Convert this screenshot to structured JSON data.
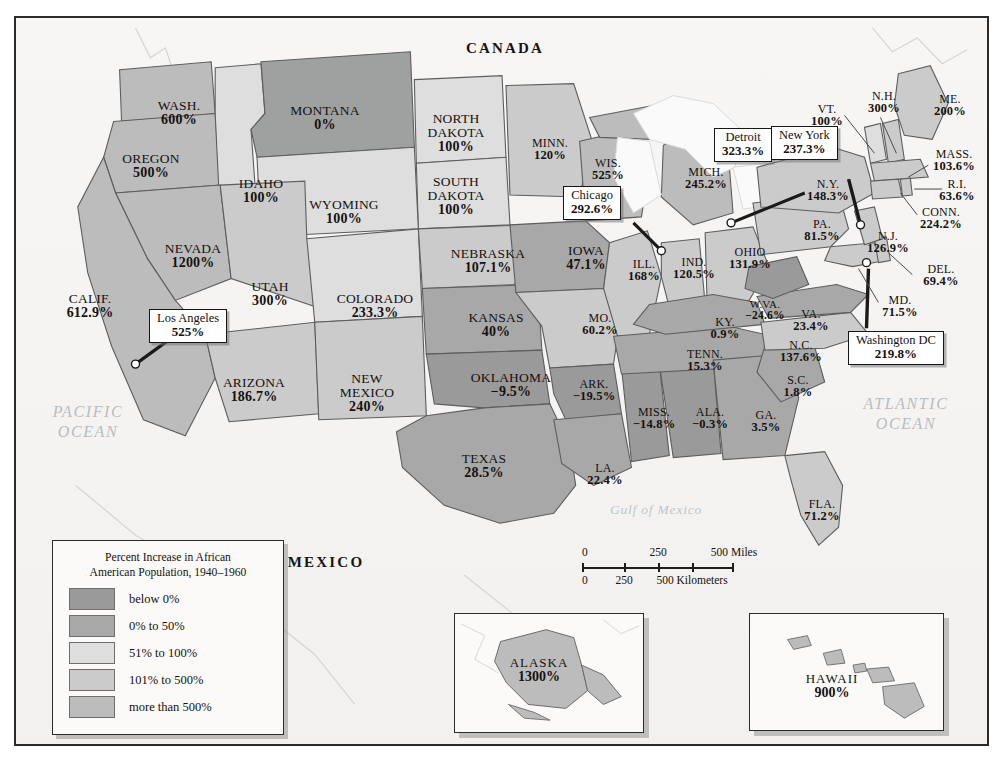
{
  "map": {
    "title_countries": {
      "canada": "CANADA",
      "mexico": "MEXICO"
    },
    "oceans": {
      "pacific_line1": "PACIFIC",
      "pacific_line2": "OCEAN",
      "atlantic_line1": "ATLANTIC",
      "atlantic_line2": "OCEAN",
      "gulf": "Gulf of Mexico"
    }
  },
  "legend": {
    "title_line1": "Percent Increase in African",
    "title_line2": "American Population, 1940–1960",
    "items": [
      {
        "label": "below 0%",
        "color": "#9a9a9a"
      },
      {
        "label": "0% to 50%",
        "color": "#a8a8a8"
      },
      {
        "label": "51% to 100%",
        "color": "#dedede"
      },
      {
        "label": "101% to 500%",
        "color": "#cbcbcb"
      },
      {
        "label": "more than 500%",
        "color": "#bcbcbc"
      }
    ]
  },
  "scale": {
    "miles_ticks": [
      "0",
      "250",
      "500 Miles"
    ],
    "km_ticks": [
      "0",
      "250",
      "500 Kilometers"
    ]
  },
  "callouts": [
    {
      "name": "Los Angeles",
      "value": "525%"
    },
    {
      "name": "Chicago",
      "value": "292.6%"
    },
    {
      "name": "Detroit",
      "value": "323.3%"
    },
    {
      "name": "New York",
      "value": "237.3%"
    },
    {
      "name": "Washington DC",
      "value": "219.8%"
    }
  ],
  "insets": [
    {
      "name": "ALASKA",
      "value": "1300%"
    },
    {
      "name": "HAWAII",
      "value": "900%"
    }
  ],
  "chart_data": {
    "type": "map",
    "unit": "percent",
    "categories": [
      "WASH.",
      "OREGON",
      "IDAHO",
      "MONTANA",
      "NORTH DAKOTA",
      "SOUTH DAKOTA",
      "WYOMING",
      "NEVADA",
      "UTAH",
      "COLORADO",
      "NEBRASKA",
      "KANSAS",
      "CALIF.",
      "ARIZONA",
      "NEW MEXICO",
      "OKLAHOMA",
      "TEXAS",
      "MINN.",
      "WIS.",
      "IOWA",
      "MO.",
      "ARK.",
      "LA.",
      "MISS.",
      "ALA.",
      "ILL.",
      "IND.",
      "MICH.",
      "OHIO",
      "KY.",
      "TENN.",
      "GA.",
      "FLA.",
      "S.C.",
      "N.C.",
      "VA.",
      "W.VA.",
      "MD.",
      "DEL.",
      "PA.",
      "N.J.",
      "N.Y.",
      "CONN.",
      "R.I.",
      "MASS.",
      "VT.",
      "N.H.",
      "ME.",
      "ALASKA",
      "HAWAII"
    ],
    "values": [
      600,
      500,
      100,
      0,
      100,
      100,
      100,
      1200,
      300,
      233.3,
      107.1,
      40,
      612.9,
      186.7,
      240,
      -9.5,
      28.5,
      120,
      525,
      47.1,
      60.2,
      -19.5,
      22.4,
      -14.8,
      -0.3,
      168,
      120.5,
      245.2,
      131.9,
      0.9,
      15.3,
      3.5,
      71.2,
      1.8,
      137.6,
      23.4,
      -24.6,
      71.5,
      69.4,
      81.5,
      126.9,
      148.3,
      224.2,
      63.6,
      103.6,
      100,
      300,
      200,
      1300,
      900
    ],
    "city_values": {
      "Los Angeles": 525,
      "Chicago": 292.6,
      "Detroit": 323.3,
      "New York": 237.3,
      "Washington DC": 219.8
    },
    "bins": [
      "below 0%",
      "0% to 50%",
      "51% to 100%",
      "101% to 500%",
      "more than 500%"
    ]
  },
  "states": [
    {
      "nm": "WASH.",
      "pct": "600%",
      "x": 163,
      "y": 95,
      "cls": ""
    },
    {
      "nm": "OREGON",
      "pct": "500%",
      "x": 135,
      "y": 148,
      "cls": ""
    },
    {
      "nm": "IDAHO",
      "pct": "100%",
      "x": 245,
      "y": 173,
      "cls": ""
    },
    {
      "nm": "MONTANA",
      "pct": "0%",
      "x": 309,
      "y": 100,
      "cls": ""
    },
    {
      "nm": "NORTH\nDAKOTA",
      "pct": "100%",
      "x": 440,
      "y": 115,
      "cls": ""
    },
    {
      "nm": "SOUTH\nDAKOTA",
      "pct": "100%",
      "x": 440,
      "y": 178,
      "cls": ""
    },
    {
      "nm": "WYOMING",
      "pct": "100%",
      "x": 328,
      "y": 194,
      "cls": ""
    },
    {
      "nm": "NEVADA",
      "pct": "1200%",
      "x": 177,
      "y": 238,
      "cls": ""
    },
    {
      "nm": "UTAH",
      "pct": "300%",
      "x": 254,
      "y": 276,
      "cls": ""
    },
    {
      "nm": "COLORADO",
      "pct": "233.3%",
      "x": 359,
      "y": 288,
      "cls": ""
    },
    {
      "nm": "NEBRASKA",
      "pct": "107.1%",
      "x": 472,
      "y": 243,
      "cls": ""
    },
    {
      "nm": "KANSAS",
      "pct": "40%",
      "x": 480,
      "y": 307,
      "cls": ""
    },
    {
      "nm": "CALIF.",
      "pct": "612.9%",
      "x": 74,
      "y": 288,
      "cls": ""
    },
    {
      "nm": "ARIZONA",
      "pct": "186.7%",
      "x": 238,
      "y": 372,
      "cls": ""
    },
    {
      "nm": "NEW\nMEXICO",
      "pct": "240%",
      "x": 351,
      "y": 375,
      "cls": ""
    },
    {
      "nm": "OKLAHOMA",
      "pct": "−9.5%",
      "x": 495,
      "y": 367,
      "cls": ""
    },
    {
      "nm": "TEXAS",
      "pct": "28.5%",
      "x": 468,
      "y": 448,
      "cls": ""
    },
    {
      "nm": "MINN.",
      "pct": "120%",
      "x": 534,
      "y": 131,
      "cls": "sm"
    },
    {
      "nm": "WIS.",
      "pct": "525%",
      "x": 592,
      "y": 151,
      "cls": "sm"
    },
    {
      "nm": "IOWA",
      "pct": "47.1%",
      "x": 570,
      "y": 240,
      "cls": ""
    },
    {
      "nm": "MO.",
      "pct": "60.2%",
      "x": 584,
      "y": 306,
      "cls": "sm"
    },
    {
      "nm": "ARK.",
      "pct": "−19.5%",
      "x": 578,
      "y": 372,
      "cls": "sm"
    },
    {
      "nm": "LA.",
      "pct": "22.4%",
      "x": 589,
      "y": 456,
      "cls": "sm"
    },
    {
      "nm": "MISS.",
      "pct": "−14.8%",
      "x": 638,
      "y": 400,
      "cls": "sm"
    },
    {
      "nm": "ALA.",
      "pct": "−0.3%",
      "x": 694,
      "y": 400,
      "cls": "sm"
    },
    {
      "nm": "ILL.",
      "pct": "168%",
      "x": 628,
      "y": 252,
      "cls": "sm"
    },
    {
      "nm": "IND.",
      "pct": "120.5%",
      "x": 678,
      "y": 250,
      "cls": "sm"
    },
    {
      "nm": "MICH.",
      "pct": "245.2%",
      "x": 690,
      "y": 160,
      "cls": "sm"
    },
    {
      "nm": "OHIO",
      "pct": "131.9%",
      "x": 734,
      "y": 240,
      "cls": "sm"
    },
    {
      "nm": "KY.",
      "pct": "0.9%",
      "x": 709,
      "y": 310,
      "cls": "sm"
    },
    {
      "nm": "TENN.",
      "pct": "15.3%",
      "x": 689,
      "y": 342,
      "cls": "sm"
    },
    {
      "nm": "GA.",
      "pct": "3.5%",
      "x": 750,
      "y": 403,
      "cls": "sm"
    },
    {
      "nm": "FLA.",
      "pct": "71.2%",
      "x": 806,
      "y": 492,
      "cls": "sm"
    },
    {
      "nm": "S.C.",
      "pct": "1.8%",
      "x": 782,
      "y": 368,
      "cls": "sm"
    },
    {
      "nm": "N.C.",
      "pct": "137.6%",
      "x": 785,
      "y": 333,
      "cls": "sm"
    },
    {
      "nm": "VA.",
      "pct": "23.4%",
      "x": 795,
      "y": 302,
      "cls": "sm"
    },
    {
      "nm": "W.VA.",
      "pct": "−24.6%",
      "x": 749,
      "y": 292,
      "cls": "xs"
    },
    {
      "nm": "MD.",
      "pct": "71.5%",
      "x": 884,
      "y": 288,
      "cls": "sm"
    },
    {
      "nm": "DEL.",
      "pct": "69.4%",
      "x": 925,
      "y": 257,
      "cls": "sm"
    },
    {
      "nm": "PA.",
      "pct": "81.5%",
      "x": 806,
      "y": 212,
      "cls": "sm"
    },
    {
      "nm": "N.J.",
      "pct": "126.9%",
      "x": 872,
      "y": 224,
      "cls": "sm"
    },
    {
      "nm": "N.Y.",
      "pct": "148.3%",
      "x": 812,
      "y": 172,
      "cls": "sm"
    },
    {
      "nm": "CONN.",
      "pct": "224.2%",
      "x": 925,
      "y": 200,
      "cls": "sm"
    },
    {
      "nm": "R.I.",
      "pct": "63.6%",
      "x": 941,
      "y": 172,
      "cls": "sm"
    },
    {
      "nm": "MASS.",
      "pct": "103.6%",
      "x": 938,
      "y": 142,
      "cls": "sm"
    },
    {
      "nm": "VT.",
      "pct": "100%",
      "x": 811,
      "y": 97,
      "cls": "sm"
    },
    {
      "nm": "N.H.",
      "pct": "300%",
      "x": 868,
      "y": 84,
      "cls": "sm"
    },
    {
      "nm": "ME.",
      "pct": "200%",
      "x": 934,
      "y": 87,
      "cls": "sm"
    }
  ]
}
